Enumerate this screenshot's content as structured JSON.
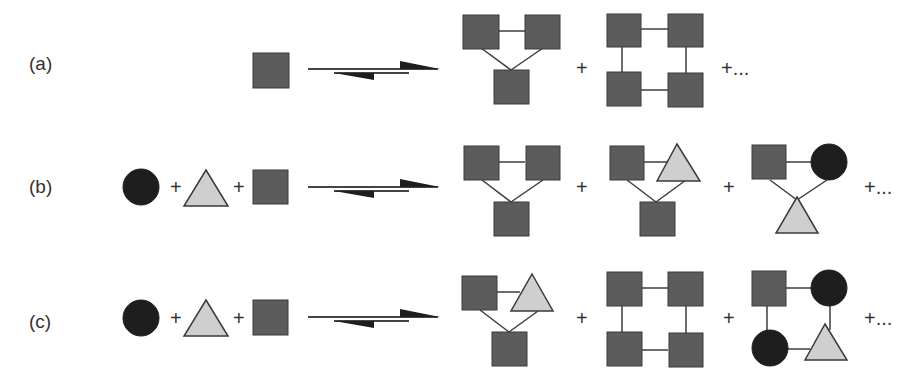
{
  "figure": {
    "type": "reaction-equilibrium-diagram",
    "colors": {
      "square": "#5c5c5c",
      "triangle": "#cfcfcf",
      "circle": "#1e1e1e",
      "bond": "#3c3c3c",
      "background": "#ffffff"
    },
    "symbols": {
      "plus": "+",
      "plus_ellipsis": "+..."
    },
    "rows": [
      {
        "label": "(a)",
        "reactants": [
          "square"
        ],
        "arrow": "equilibrium-right",
        "products": [
          "triangle-of-three-squares",
          "ring-of-four-squares"
        ],
        "trailing": "+..."
      },
      {
        "label": "(b)",
        "reactants": [
          "circle",
          "triangle",
          "square"
        ],
        "arrow": "equilibrium-right",
        "products": [
          "triangle-of-three-squares",
          "square-triangle-square",
          "square-circle-triangle"
        ],
        "trailing": "+..."
      },
      {
        "label": "(c)",
        "reactants": [
          "circle",
          "triangle",
          "square"
        ],
        "arrow": "equilibrium-right",
        "products": [
          "square-triangle-square",
          "ring-of-four-squares",
          "ring-square-circle-triangle-circle"
        ],
        "trailing": "+..."
      }
    ]
  }
}
